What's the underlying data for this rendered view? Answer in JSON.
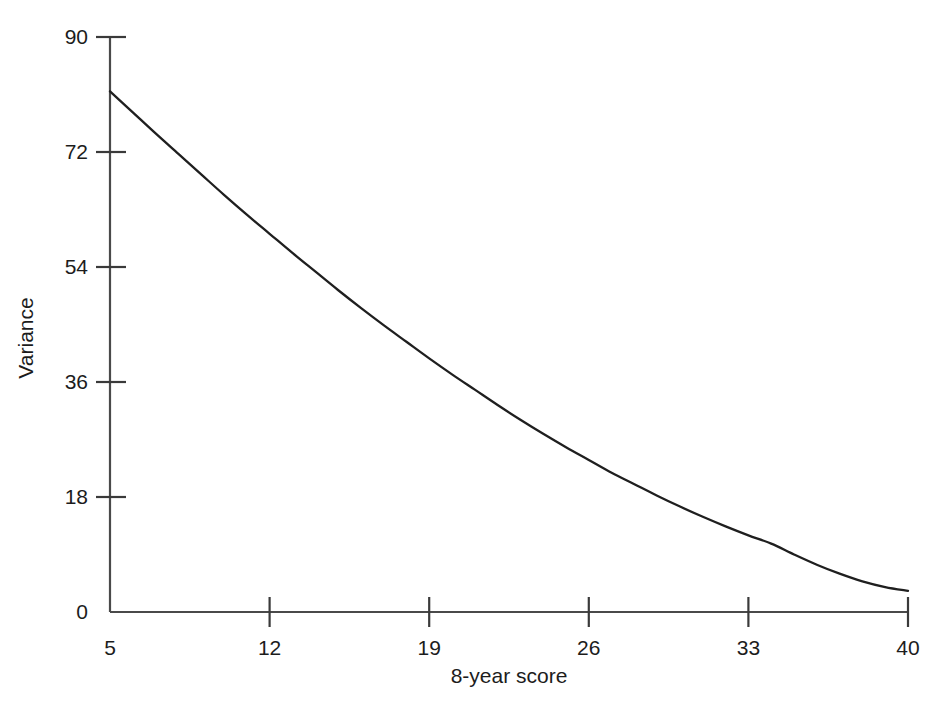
{
  "chart_data": {
    "type": "line",
    "title": "",
    "xlabel": "8-year score",
    "ylabel": "Variance",
    "xlim": [
      5,
      40
    ],
    "ylim": [
      0,
      90
    ],
    "grid": false,
    "legend": null,
    "x_ticks": [
      5,
      12,
      19,
      26,
      33,
      40
    ],
    "y_ticks": [
      0,
      18,
      36,
      54,
      72,
      90
    ],
    "x_tick_labels": [
      "5",
      "12",
      "19",
      "26",
      "33",
      "40"
    ],
    "y_tick_labels": [
      "0",
      "18",
      "36",
      "54",
      "72",
      "90"
    ],
    "series": [
      {
        "name": "Variance",
        "color": "#1f1f1f",
        "x": [
          5,
          6,
          7,
          8,
          9,
          10,
          11,
          12,
          13,
          14,
          15,
          16,
          17,
          18,
          19,
          20,
          21,
          22,
          23,
          24,
          25,
          26,
          27,
          28,
          29,
          30,
          31,
          32,
          33,
          34,
          35,
          36,
          37,
          38,
          39,
          40
        ],
        "y": [
          81.5,
          78.2,
          74.9,
          71.7,
          68.5,
          65.3,
          62.2,
          59.2,
          56.2,
          53.3,
          50.4,
          47.6,
          44.9,
          42.3,
          39.7,
          37.2,
          34.8,
          32.4,
          30.1,
          27.9,
          25.8,
          23.8,
          21.8,
          20.0,
          18.2,
          16.5,
          14.9,
          13.4,
          12.0,
          10.7,
          9.0,
          7.4,
          6.0,
          4.8,
          3.9,
          3.3
        ]
      }
    ]
  },
  "axes": {
    "x_title": "8-year score",
    "y_title": "Variance"
  }
}
